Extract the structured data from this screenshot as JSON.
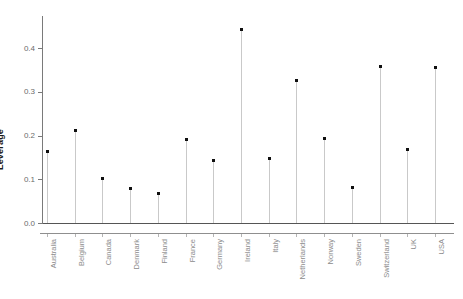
{
  "chart_data": {
    "type": "scatter",
    "subtype": "lollipop",
    "title": "",
    "xlabel": "",
    "ylabel": "Leverage",
    "categories": [
      "Australia",
      "Belgium",
      "Canada",
      "Denmark",
      "Finland",
      "France",
      "Germany",
      "Ireland",
      "Italy",
      "Netherlands",
      "Norway",
      "Sweden",
      "Switzerland",
      "UK",
      "USA"
    ],
    "values": [
      0.163,
      0.211,
      0.102,
      0.078,
      0.068,
      0.192,
      0.143,
      0.443,
      0.148,
      0.326,
      0.194,
      0.082,
      0.358,
      0.168,
      0.355
    ],
    "ylim": [
      -0.022,
      0.472
    ],
    "ytick_labels": [
      "0.0",
      "0.1",
      "0.2",
      "0.3",
      "0.4"
    ],
    "ytick_values": [
      0.0,
      0.1,
      0.2,
      0.3,
      0.4
    ],
    "grid": false,
    "legend": null,
    "marker_color": "#101010",
    "stem_color": "#c9c9c9",
    "axis_color": "#7a7a7a",
    "zero_line_color": "#555555",
    "label_color": "#8c8c8c",
    "background": "#ffffff"
  }
}
